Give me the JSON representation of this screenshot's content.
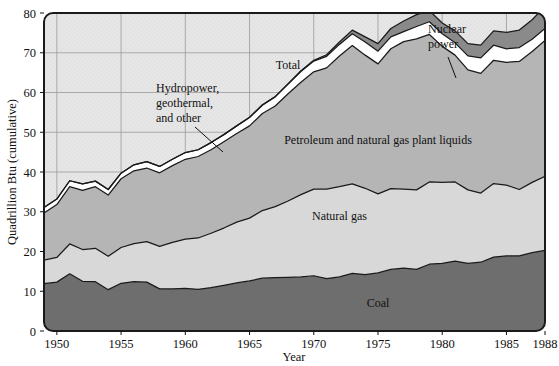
{
  "chart_data": {
    "type": "area",
    "title": "",
    "xlabel": "Year",
    "ylabel": "Quadrillion Btu (cumulative)",
    "xlim": [
      1949,
      1988
    ],
    "ylim": [
      0,
      80
    ],
    "grid": true,
    "stacked": true,
    "legend_position": "inline-annotations",
    "x_tick_labels": [
      "1950",
      "1955",
      "1960",
      "1965",
      "1970",
      "1975",
      "1980",
      "1985",
      "1988"
    ],
    "x_ticks": [
      1950,
      1955,
      1960,
      1965,
      1970,
      1975,
      1980,
      1985,
      1988
    ],
    "y_tick_labels": [
      "0",
      "10",
      "20",
      "30",
      "40",
      "50",
      "60",
      "70",
      "80"
    ],
    "y_ticks": [
      0,
      10,
      20,
      30,
      40,
      50,
      60,
      70,
      80
    ],
    "x": [
      1949,
      1950,
      1951,
      1952,
      1953,
      1954,
      1955,
      1956,
      1957,
      1958,
      1959,
      1960,
      1961,
      1962,
      1963,
      1964,
      1965,
      1966,
      1967,
      1968,
      1969,
      1970,
      1971,
      1972,
      1973,
      1974,
      1975,
      1976,
      1977,
      1978,
      1979,
      1980,
      1981,
      1982,
      1983,
      1984,
      1985,
      1986,
      1987,
      1988
    ],
    "series": [
      {
        "name": "Coal",
        "color": "#6e6e6e",
        "label_x": 1975,
        "label_y": 6,
        "values": [
          11.9,
          12.3,
          14.4,
          12.5,
          12.4,
          10.4,
          12.0,
          12.4,
          12.3,
          10.6,
          10.6,
          10.7,
          10.5,
          10.9,
          11.5,
          12.1,
          12.6,
          13.3,
          13.4,
          13.5,
          13.6,
          13.9,
          13.2,
          13.6,
          14.5,
          14.2,
          14.6,
          15.5,
          15.8,
          15.5,
          16.8,
          17.0,
          17.6,
          17.0,
          17.3,
          18.6,
          18.9,
          18.9,
          19.7,
          20.3
        ]
      },
      {
        "name": "Natural gas",
        "color": "#d8d8d8",
        "label_x": 1972,
        "label_y": 28,
        "values": [
          5.9,
          6.2,
          7.5,
          8.0,
          8.4,
          8.4,
          9.0,
          9.6,
          10.2,
          10.7,
          11.7,
          12.4,
          12.9,
          13.7,
          14.4,
          15.3,
          15.8,
          17.0,
          17.9,
          19.2,
          20.7,
          21.8,
          22.5,
          22.7,
          22.5,
          21.7,
          19.9,
          20.3,
          19.9,
          20.0,
          20.7,
          20.4,
          19.9,
          18.5,
          17.4,
          18.5,
          17.8,
          16.7,
          17.7,
          18.6
        ]
      },
      {
        "name": "Petroleum and natural gas plant liquids",
        "color": "#b5b5b5",
        "label_x": 1975,
        "label_y": 47,
        "values": [
          11.9,
          13.3,
          14.4,
          14.9,
          15.5,
          15.4,
          17.3,
          18.3,
          18.5,
          18.5,
          19.3,
          20.1,
          20.5,
          21.0,
          21.7,
          22.3,
          23.2,
          24.4,
          25.3,
          27.0,
          28.3,
          29.5,
          30.5,
          32.9,
          34.8,
          33.5,
          32.7,
          35.2,
          37.1,
          38.0,
          37.1,
          34.2,
          31.9,
          30.2,
          30.1,
          31.0,
          30.9,
          32.2,
          32.9,
          34.2
        ]
      },
      {
        "name": "Hydropower, geothermal, and other",
        "color": "#ffffff",
        "values": [
          1.4,
          1.4,
          1.5,
          1.6,
          1.4,
          1.4,
          1.4,
          1.5,
          1.6,
          1.6,
          1.6,
          1.7,
          1.7,
          1.8,
          1.8,
          1.9,
          2.1,
          2.1,
          2.3,
          2.4,
          2.7,
          2.7,
          2.9,
          2.9,
          3.0,
          3.3,
          3.2,
          3.0,
          2.5,
          3.1,
          3.2,
          3.2,
          3.1,
          3.5,
          3.9,
          3.8,
          3.4,
          3.5,
          3.1,
          3.0
        ]
      },
      {
        "name": "Nuclear power",
        "color": "#8a8a8a",
        "values": [
          0.0,
          0.0,
          0.0,
          0.0,
          0.0,
          0.0,
          0.0,
          0.0,
          0.0,
          0.0,
          0.0,
          0.0,
          0.0,
          0.0,
          0.0,
          0.0,
          0.1,
          0.1,
          0.1,
          0.1,
          0.2,
          0.2,
          0.4,
          0.6,
          0.9,
          1.3,
          1.9,
          2.1,
          2.7,
          3.0,
          2.8,
          2.7,
          3.0,
          3.1,
          3.2,
          3.6,
          4.1,
          4.4,
          4.9,
          5.6
        ]
      }
    ],
    "total_label": "Total",
    "total_label_x": 1968,
    "total_label_y": 66,
    "annotations": [
      {
        "text": "Hydropower,\ngeothermal,\nand other",
        "lines": [
          "Hydropower,",
          "geothermal,",
          "and other"
        ],
        "text_x": 156,
        "text_y": 92,
        "leader_from_x": 195,
        "leader_from_y": 127,
        "leader_to_x": 223,
        "leader_to_y": 152
      },
      {
        "text": "Nuclear\npower",
        "lines": [
          "Nuclear",
          "power"
        ],
        "text_x": 428,
        "text_y": 33,
        "leader_from_x": 448,
        "leader_from_y": 57,
        "leader_to_x": 456,
        "leader_to_y": 78
      }
    ],
    "colors": {
      "coal": "#6e6e6e",
      "natural_gas": "#d8d8d8",
      "petroleum": "#b5b5b5",
      "hydro_other": "#ffffff",
      "nuclear": "#8a8a8a",
      "plot_background": "#e3e3e3",
      "gridline": "#9a9a9a",
      "outline": "#1a1a1a",
      "text": "#111111"
    }
  }
}
